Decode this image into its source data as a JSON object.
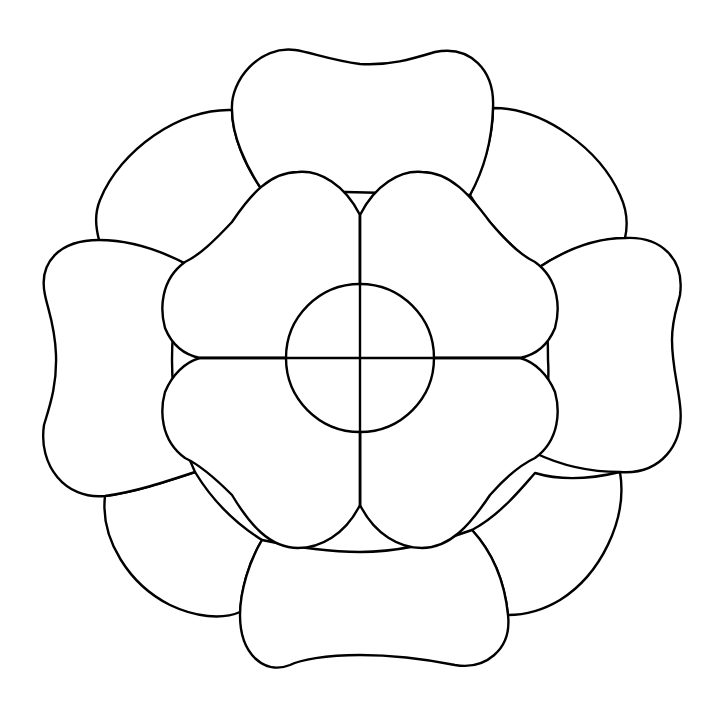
{
  "figure": {
    "background_color": "#ffffff",
    "line_color": "#000000",
    "center": [
      360,
      358
    ],
    "outer_petals": {
      "count": 8,
      "large_petals": [
        "top",
        "right",
        "bottom",
        "left"
      ],
      "small_petals": [
        "top-left",
        "top-right",
        "bottom-right",
        "bottom-left"
      ]
    },
    "inner_petals": {
      "count": 4,
      "style": "heart-shaped pairs divided by cross lines"
    },
    "center_circle": {
      "cx": 360,
      "cy": 358,
      "r": 74
    },
    "dividing_lines": [
      "vertical",
      "horizontal"
    ]
  }
}
